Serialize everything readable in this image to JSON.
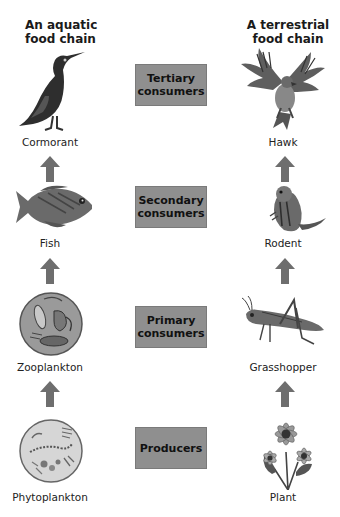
{
  "titles": {
    "aquatic": "An aquatic\nfood chain",
    "terrestrial": "A terrestrial\nfood chain"
  },
  "levels": [
    {
      "label": "Tertiary\nconsumers",
      "aquatic": "Cormorant",
      "terrestrial": "Hawk"
    },
    {
      "label": "Secondary\nconsumers",
      "aquatic": "Fish",
      "terrestrial": "Rodent"
    },
    {
      "label": "Primary\nconsumers",
      "aquatic": "Zooplankton",
      "terrestrial": "Grasshopper"
    },
    {
      "label": "Producers",
      "aquatic": "Phytoplankton",
      "terrestrial": "Plant"
    }
  ],
  "colors": {
    "box_fill": "#8f8f8f",
    "arrow_fill": "#6e6e6e"
  }
}
